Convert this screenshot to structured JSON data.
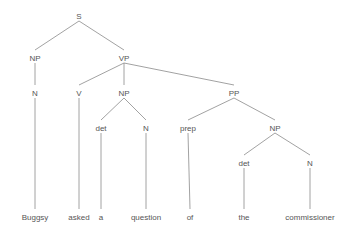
{
  "diagram": {
    "type": "parse-tree",
    "nodes": [
      {
        "id": "S",
        "label": "S",
        "x": 79,
        "y": 16
      },
      {
        "id": "NP1",
        "label": "NP",
        "x": 35,
        "y": 58
      },
      {
        "id": "VP",
        "label": "VP",
        "x": 124,
        "y": 58
      },
      {
        "id": "N1",
        "label": "N",
        "x": 35,
        "y": 93
      },
      {
        "id": "V",
        "label": "V",
        "x": 79,
        "y": 93
      },
      {
        "id": "NP2",
        "label": "NP",
        "x": 124,
        "y": 93
      },
      {
        "id": "PP",
        "label": "PP",
        "x": 234,
        "y": 93
      },
      {
        "id": "det1",
        "label": "det",
        "x": 101,
        "y": 128
      },
      {
        "id": "N2",
        "label": "N",
        "x": 146,
        "y": 128
      },
      {
        "id": "prep",
        "label": "prep",
        "x": 188,
        "y": 128
      },
      {
        "id": "NP3",
        "label": "NP",
        "x": 275,
        "y": 128
      },
      {
        "id": "det2",
        "label": "det",
        "x": 244,
        "y": 163
      },
      {
        "id": "N3",
        "label": "N",
        "x": 310,
        "y": 163
      },
      {
        "id": "w1",
        "label": "Buggsy",
        "x": 35,
        "y": 217
      },
      {
        "id": "w2",
        "label": "asked",
        "x": 79,
        "y": 217
      },
      {
        "id": "w3",
        "label": "a",
        "x": 101,
        "y": 217
      },
      {
        "id": "w4",
        "label": "question",
        "x": 146,
        "y": 217
      },
      {
        "id": "w5",
        "label": "of",
        "x": 190,
        "y": 217
      },
      {
        "id": "w6",
        "label": "the",
        "x": 244,
        "y": 217
      },
      {
        "id": "w7",
        "label": "commissioner",
        "x": 310,
        "y": 217
      }
    ],
    "edges": [
      [
        "S",
        "NP1"
      ],
      [
        "S",
        "VP"
      ],
      [
        "NP1",
        "N1"
      ],
      [
        "N1",
        "w1"
      ],
      [
        "VP",
        "V"
      ],
      [
        "VP",
        "NP2"
      ],
      [
        "VP",
        "PP"
      ],
      [
        "V",
        "w2"
      ],
      [
        "NP2",
        "det1"
      ],
      [
        "NP2",
        "N2"
      ],
      [
        "det1",
        "w3"
      ],
      [
        "N2",
        "w4"
      ],
      [
        "PP",
        "prep"
      ],
      [
        "PP",
        "NP3"
      ],
      [
        "prep",
        "w5"
      ],
      [
        "NP3",
        "det2"
      ],
      [
        "NP3",
        "N3"
      ],
      [
        "det2",
        "w6"
      ],
      [
        "N3",
        "w7"
      ]
    ],
    "colors": {
      "line": "#8a8a8a",
      "text": "#555555",
      "background": "#ffffff"
    }
  }
}
